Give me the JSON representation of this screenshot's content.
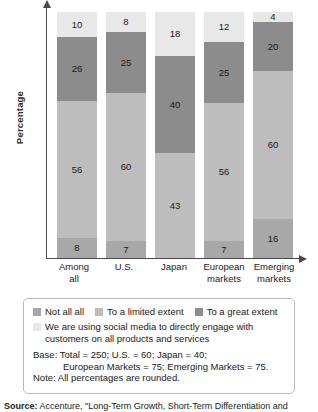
{
  "chart_data": {
    "type": "bar",
    "variant": "stacked-100",
    "title": "",
    "xlabel": "",
    "ylabel": "Percentage",
    "ylim": [
      0,
      100
    ],
    "grid": false,
    "legend_position": "bottom",
    "categories": [
      "Among all",
      "U.S.",
      "Japan",
      "European markets",
      "Emerging markets"
    ],
    "category_lines": [
      [
        "Among",
        "all"
      ],
      [
        "U.S."
      ],
      [
        "Japan"
      ],
      [
        "European",
        "markets"
      ],
      [
        "Emerging",
        "markets"
      ]
    ],
    "series": [
      {
        "name": "Not all all",
        "color": "#a8a8a8",
        "values": [
          8,
          7,
          0,
          7,
          16
        ]
      },
      {
        "name": "To a limited extent",
        "color": "#bdbdbd",
        "values": [
          56,
          60,
          43,
          56,
          60
        ]
      },
      {
        "name": "To a great extent",
        "color": "#8c8c8c",
        "values": [
          26,
          25,
          40,
          25,
          20
        ]
      },
      {
        "name": "We are using social media to directly engage with customers on all products and services",
        "color": "#e8e8e8",
        "values": [
          10,
          8,
          18,
          12,
          4
        ]
      }
    ]
  },
  "axes": {
    "y_label": "Percentage",
    "y_arrow": "arrow-up-icon",
    "x_arrow": "arrow-right-icon"
  },
  "legend": {
    "items": [
      {
        "label": "Not all all",
        "color": "#a8a8a8"
      },
      {
        "label": "To a limited extent",
        "color": "#bdbdbd"
      },
      {
        "label": "To a great extent",
        "color": "#8c8c8c"
      }
    ],
    "wrapped_item": {
      "label": "We are using social media to directly engage with customers on all products and services",
      "color": "#e8e8e8"
    },
    "base_line1": "Base: Total = 250; U.S. = 60; Japan = 40;",
    "base_line2": "European Markets = 75; Emerging Markets = 75.",
    "note": "Note: All percentages are rounded."
  },
  "source": {
    "label": "Source:",
    "text": "Accenture, \"Long-Term Growth, Short-Term Differentiation and"
  }
}
